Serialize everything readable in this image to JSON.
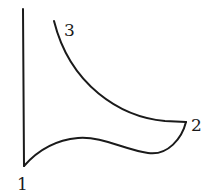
{
  "diagram": {
    "type": "cycle-curve",
    "stroke_color": "#1a1a1a",
    "background": "#ffffff",
    "points": [
      {
        "id": "1",
        "label": "1",
        "x": 24,
        "y": 166,
        "label_x": 17,
        "label_y": 190
      },
      {
        "id": "2",
        "label": "2",
        "x": 186,
        "y": 122,
        "label_x": 191,
        "label_y": 131
      },
      {
        "id": "3",
        "label": "3",
        "x": 54,
        "y": 21,
        "label_x": 64,
        "label_y": 36
      }
    ],
    "segments": [
      {
        "name": "axis-vertical",
        "from": "top",
        "to": "1",
        "path": "M23,9 L24,166"
      },
      {
        "name": "curve-1-to-2",
        "from": "1",
        "to": "2",
        "path": "M24,166 C38,150 55,140 78,138 C102,136 125,150 148,153 C168,156 182,138 186,122"
      },
      {
        "name": "curve-2-to-3",
        "from": "2",
        "to": "3",
        "path": "M186,122 L165,121 C120,117 70,85 54,21"
      }
    ]
  }
}
